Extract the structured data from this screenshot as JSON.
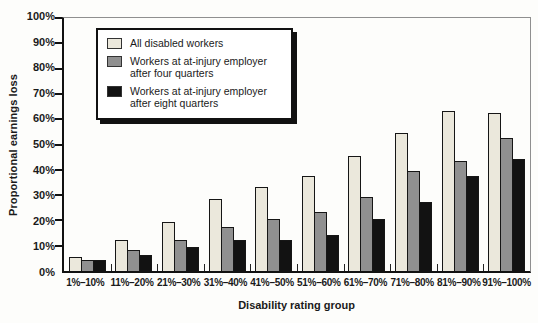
{
  "figure": {
    "y_axis_title": "Proportional earnings loss",
    "x_axis_title": "Disability rating group"
  },
  "legend": {
    "items": [
      {
        "label": "All disabled workers",
        "color": "#ebe8dc"
      },
      {
        "label": "Workers at at-injury employer after four quarters",
        "color": "#909090"
      },
      {
        "label": "Workers at at-injury employer after eight quarters",
        "color": "#121212"
      }
    ]
  },
  "chart_data": {
    "type": "bar",
    "title": "",
    "xlabel": "Disability rating group",
    "ylabel": "Proportional earnings loss",
    "ylim": [
      0,
      100
    ],
    "grid": false,
    "legend_position": "top-left-inside",
    "y_tick_labels": [
      "0%",
      "10%",
      "20%",
      "30%",
      "40%",
      "50%",
      "60%",
      "70%",
      "80%",
      "90%",
      "100%"
    ],
    "categories": [
      "1%–10%",
      "11%–20%",
      "21%–30%",
      "31%–40%",
      "41%–50%",
      "51%–60%",
      "61%–70%",
      "71%–80%",
      "81%–90%",
      "91%–100%"
    ],
    "series": [
      {
        "name": "All disabled workers",
        "color": "#ebe8dc",
        "values": [
          5,
          12,
          19,
          28,
          33,
          37,
          45,
          54,
          63,
          62
        ]
      },
      {
        "name": "Workers at at-injury employer after four quarters",
        "color": "#909090",
        "values": [
          4,
          8,
          12,
          17,
          20,
          23,
          29,
          39,
          43,
          52
        ]
      },
      {
        "name": "Workers at at-injury employer after eight quarters",
        "color": "#121212",
        "values": [
          4,
          6,
          9,
          12,
          12,
          14,
          20,
          27,
          37,
          44
        ]
      }
    ]
  }
}
